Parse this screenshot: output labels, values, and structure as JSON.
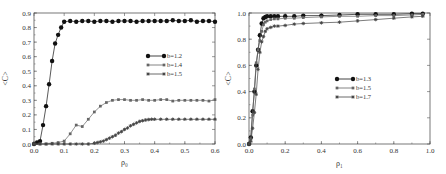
{
  "chart_data": [
    {
      "type": "line",
      "title": "",
      "xlabel": "ρ₀",
      "ylabel": "<C>",
      "xlim": [
        0.0,
        0.6
      ],
      "ylim": [
        0.0,
        0.9
      ],
      "xticks": [
        "0.0",
        "0.1",
        "0.2",
        "0.3",
        "0.4",
        "0.5",
        "0.6"
      ],
      "yticks": [
        "0.0",
        "0.1",
        "0.2",
        "0.3",
        "0.4",
        "0.5",
        "0.6",
        "0.7",
        "0.8",
        "0.9"
      ],
      "grid": false,
      "legend_position": "center-right",
      "series": [
        {
          "name": "b=1.2",
          "marker": "circle",
          "color": "#111111",
          "x": [
            0.0,
            0.01,
            0.02,
            0.03,
            0.04,
            0.05,
            0.06,
            0.07,
            0.08,
            0.09,
            0.1,
            0.12,
            0.14,
            0.16,
            0.18,
            0.2,
            0.22,
            0.24,
            0.26,
            0.28,
            0.3,
            0.32,
            0.34,
            0.36,
            0.38,
            0.4,
            0.42,
            0.44,
            0.46,
            0.48,
            0.5,
            0.52,
            0.54,
            0.56,
            0.58,
            0.6
          ],
          "y": [
            0.0,
            0.01,
            0.02,
            0.13,
            0.26,
            0.41,
            0.57,
            0.69,
            0.75,
            0.8,
            0.84,
            0.845,
            0.84,
            0.845,
            0.845,
            0.84,
            0.845,
            0.845,
            0.84,
            0.845,
            0.845,
            0.845,
            0.84,
            0.845,
            0.845,
            0.845,
            0.845,
            0.845,
            0.85,
            0.845,
            0.845,
            0.85,
            0.84,
            0.845,
            0.845,
            0.84
          ]
        },
        {
          "name": "b=1.4",
          "marker": "square",
          "color": "#666666",
          "x": [
            0.0,
            0.02,
            0.04,
            0.06,
            0.08,
            0.1,
            0.12,
            0.14,
            0.16,
            0.18,
            0.2,
            0.22,
            0.24,
            0.26,
            0.28,
            0.3,
            0.32,
            0.34,
            0.36,
            0.38,
            0.4,
            0.42,
            0.44,
            0.46,
            0.48,
            0.5,
            0.52,
            0.54,
            0.56,
            0.58,
            0.6
          ],
          "y": [
            0.0,
            0.0,
            0.0,
            0.005,
            0.01,
            0.02,
            0.07,
            0.13,
            0.12,
            0.17,
            0.22,
            0.26,
            0.285,
            0.3,
            0.305,
            0.305,
            0.3,
            0.3,
            0.305,
            0.3,
            0.3,
            0.305,
            0.305,
            0.295,
            0.3,
            0.3,
            0.3,
            0.3,
            0.3,
            0.295,
            0.305
          ]
        },
        {
          "name": "b=1.5",
          "marker": "star",
          "color": "#444444",
          "x": [
            0.0,
            0.02,
            0.04,
            0.06,
            0.08,
            0.1,
            0.12,
            0.14,
            0.16,
            0.18,
            0.2,
            0.21,
            0.22,
            0.23,
            0.24,
            0.25,
            0.26,
            0.27,
            0.28,
            0.29,
            0.3,
            0.31,
            0.32,
            0.33,
            0.34,
            0.35,
            0.36,
            0.37,
            0.38,
            0.39,
            0.4,
            0.42,
            0.44,
            0.46,
            0.48,
            0.5,
            0.52,
            0.54,
            0.56,
            0.58,
            0.6
          ],
          "y": [
            0.0,
            0.0,
            0.0,
            0.0,
            0.0,
            0.0,
            0.0,
            0.0,
            0.0,
            0.0,
            0.005,
            0.01,
            0.015,
            0.02,
            0.03,
            0.04,
            0.05,
            0.06,
            0.075,
            0.085,
            0.1,
            0.11,
            0.125,
            0.135,
            0.145,
            0.155,
            0.16,
            0.165,
            0.168,
            0.17,
            0.17,
            0.17,
            0.17,
            0.17,
            0.17,
            0.17,
            0.17,
            0.17,
            0.17,
            0.17,
            0.17
          ]
        }
      ]
    },
    {
      "type": "line",
      "title": "",
      "xlabel": "ρ₁",
      "ylabel": "<C>",
      "xlim": [
        0.0,
        1.0
      ],
      "ylim": [
        0.0,
        1.0
      ],
      "xticks": [
        "0.0",
        "0.2",
        "0.4",
        "0.6",
        "0.8",
        "1.0"
      ],
      "yticks": [
        "0.0",
        "0.2",
        "0.4",
        "0.6",
        "0.8",
        "1.0"
      ],
      "grid": false,
      "legend_position": "center",
      "series": [
        {
          "name": "b=1.3",
          "marker": "circle",
          "color": "#111111",
          "x": [
            0.0,
            0.01,
            0.02,
            0.03,
            0.04,
            0.05,
            0.06,
            0.07,
            0.08,
            0.09,
            0.1,
            0.12,
            0.14,
            0.16,
            0.2,
            0.25,
            0.3,
            0.4,
            0.5,
            0.6,
            0.7,
            0.8,
            0.9,
            0.96
          ],
          "y": [
            0.0,
            0.05,
            0.25,
            0.4,
            0.6,
            0.72,
            0.83,
            0.92,
            0.96,
            0.97,
            0.975,
            0.975,
            0.975,
            0.975,
            0.975,
            0.975,
            0.98,
            0.98,
            0.985,
            0.99,
            0.99,
            0.99,
            0.995,
            0.995
          ]
        },
        {
          "name": "b=1.5",
          "marker": "square",
          "color": "#666666",
          "x": [
            0.0,
            0.01,
            0.02,
            0.03,
            0.04,
            0.05,
            0.06,
            0.07,
            0.08,
            0.09,
            0.1,
            0.12,
            0.14,
            0.16,
            0.2,
            0.25,
            0.3,
            0.4,
            0.5,
            0.6,
            0.7,
            0.8,
            0.9,
            0.96
          ],
          "y": [
            0.0,
            0.04,
            0.22,
            0.42,
            0.62,
            0.72,
            0.79,
            0.86,
            0.91,
            0.93,
            0.94,
            0.95,
            0.955,
            0.955,
            0.96,
            0.96,
            0.965,
            0.97,
            0.975,
            0.975,
            0.98,
            0.98,
            0.985,
            0.99
          ]
        },
        {
          "name": "b=1.7",
          "marker": "star",
          "color": "#444444",
          "x": [
            0.0,
            0.01,
            0.02,
            0.03,
            0.04,
            0.05,
            0.06,
            0.07,
            0.08,
            0.09,
            0.1,
            0.12,
            0.14,
            0.16,
            0.2,
            0.25,
            0.3,
            0.4,
            0.5,
            0.6,
            0.7,
            0.8,
            0.9,
            0.96
          ],
          "y": [
            0.0,
            0.02,
            0.12,
            0.24,
            0.38,
            0.57,
            0.7,
            0.78,
            0.82,
            0.86,
            0.88,
            0.89,
            0.9,
            0.9,
            0.905,
            0.915,
            0.92,
            0.925,
            0.93,
            0.94,
            0.95,
            0.96,
            0.97,
            0.975
          ]
        }
      ]
    }
  ]
}
